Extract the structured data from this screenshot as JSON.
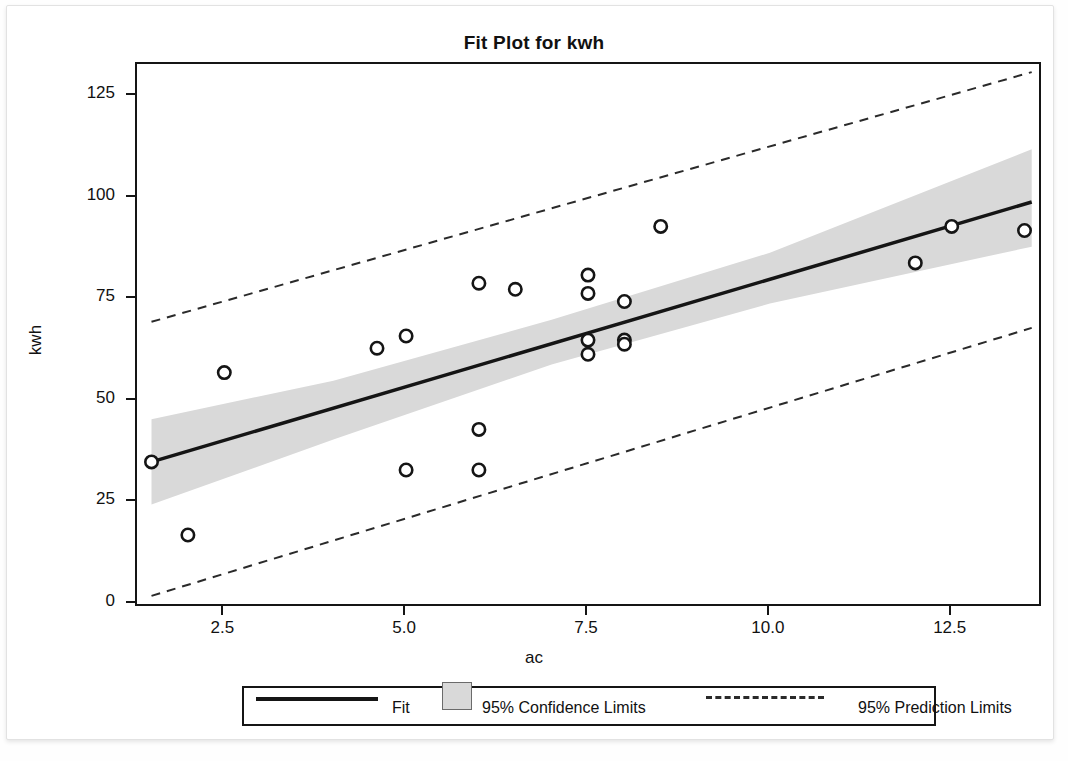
{
  "title": "Fit Plot for kwh",
  "axes": {
    "x_label": "ac",
    "y_label": "kwh",
    "x_ticks": [
      "2.5",
      "5.0",
      "7.5",
      "10.0",
      "12.5"
    ],
    "y_ticks": [
      "0",
      "25",
      "50",
      "75",
      "100",
      "125"
    ]
  },
  "legend": {
    "fit": "Fit",
    "confidence": "95% Confidence Limits",
    "prediction": "95% Prediction Limits"
  },
  "colors": {
    "line": "#151515",
    "band": "#d9d9d9",
    "marker": "#151515",
    "frame": "#151515",
    "background": "#ffffff"
  },
  "chart_data": {
    "type": "scatter",
    "title": "Fit Plot for kwh",
    "xlabel": "ac",
    "ylabel": "kwh",
    "xlim": [
      1.3,
      13.7
    ],
    "ylim": [
      0,
      133
    ],
    "x_ticks": [
      2.5,
      5.0,
      7.5,
      10.0,
      12.5
    ],
    "y_ticks": [
      0,
      25,
      50,
      75,
      100,
      125
    ],
    "grid": false,
    "legend_position": "bottom",
    "series": [
      {
        "name": "Observations",
        "type": "scatter",
        "marker": "open-circle",
        "points": [
          {
            "x": 1.5,
            "y": 35.0
          },
          {
            "x": 2.0,
            "y": 17.0
          },
          {
            "x": 2.5,
            "y": 57.0
          },
          {
            "x": 4.6,
            "y": 63.0
          },
          {
            "x": 5.0,
            "y": 66.0
          },
          {
            "x": 5.0,
            "y": 33.0
          },
          {
            "x": 6.0,
            "y": 79.0
          },
          {
            "x": 6.0,
            "y": 43.0
          },
          {
            "x": 6.0,
            "y": 33.0
          },
          {
            "x": 6.5,
            "y": 77.5
          },
          {
            "x": 7.5,
            "y": 81.0
          },
          {
            "x": 7.5,
            "y": 76.5
          },
          {
            "x": 7.5,
            "y": 65.0
          },
          {
            "x": 7.5,
            "y": 61.5
          },
          {
            "x": 8.0,
            "y": 74.5
          },
          {
            "x": 8.0,
            "y": 65.0
          },
          {
            "x": 8.0,
            "y": 64.0
          },
          {
            "x": 8.5,
            "y": 93.0
          },
          {
            "x": 12.0,
            "y": 84.0
          },
          {
            "x": 12.5,
            "y": 93.0
          },
          {
            "x": 13.5,
            "y": 92.0
          }
        ]
      },
      {
        "name": "Fit",
        "type": "line",
        "style": "solid",
        "points": [
          {
            "x": 1.5,
            "y": 35.0
          },
          {
            "x": 13.6,
            "y": 99.0
          }
        ]
      },
      {
        "name": "95% Confidence Limits",
        "type": "band",
        "upper": [
          {
            "x": 1.5,
            "y": 45.5
          },
          {
            "x": 4.0,
            "y": 55.0
          },
          {
            "x": 7.0,
            "y": 70.0
          },
          {
            "x": 10.0,
            "y": 86.5
          },
          {
            "x": 13.6,
            "y": 112.0
          }
        ],
        "lower": [
          {
            "x": 1.5,
            "y": 24.5
          },
          {
            "x": 4.0,
            "y": 40.5
          },
          {
            "x": 7.0,
            "y": 59.0
          },
          {
            "x": 10.0,
            "y": 74.0
          },
          {
            "x": 13.6,
            "y": 88.0
          }
        ]
      },
      {
        "name": "95% Prediction Limits",
        "type": "line-pair",
        "style": "dashed",
        "upper": [
          {
            "x": 1.5,
            "y": 69.5
          },
          {
            "x": 13.6,
            "y": 131.0
          }
        ],
        "lower": [
          {
            "x": 1.5,
            "y": 2.0
          },
          {
            "x": 13.6,
            "y": 68.0
          }
        ]
      }
    ]
  }
}
